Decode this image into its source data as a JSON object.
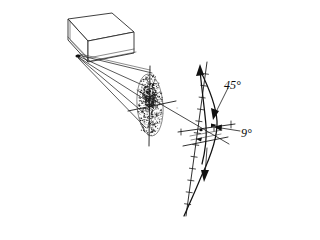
{
  "figure": {
    "background_color": "#ffffff",
    "ink_color": "#111111",
    "width": 268,
    "height": 235
  },
  "labels": {
    "angle_45": "45°",
    "angle_9": "9°",
    "ray_tick_mark": "°"
  },
  "components": {
    "source_box_name": "laser source box",
    "ray_fan_name": "emitted ray fan",
    "scatter_cloud_name": "stippled scattering cloud",
    "probe_axis_name": "tick-marked probe axis",
    "profile_curve_name": "S-shaped profile curve",
    "crosshair_name": "crosshair axes"
  },
  "chart_data": {
    "type": "line",
    "xlabel": "",
    "ylabel": "",
    "annotations": [
      {
        "text": "45°",
        "x": 232,
        "y": 86
      },
      {
        "text": "9°",
        "x": 243,
        "y": 134
      }
    ],
    "series": [
      {
        "name": "profile curve",
        "points": [
          [
            200,
            68
          ],
          [
            208,
            84
          ],
          [
            214,
            100
          ],
          [
            217,
            116
          ],
          [
            216,
            128
          ],
          [
            212,
            142
          ],
          [
            206,
            158
          ],
          [
            199,
            176
          ],
          [
            192,
            196
          ],
          [
            186,
            212
          ]
        ]
      },
      {
        "name": "probe axis",
        "points": [
          [
            207,
            62
          ],
          [
            186,
            216
          ]
        ]
      }
    ],
    "grid": false,
    "legend": "none"
  },
  "ray_fan": {
    "origin": {
      "x": 77,
      "y": 56
    },
    "targets": [
      {
        "x": 150,
        "y": 74
      },
      {
        "x": 147,
        "y": 88
      },
      {
        "x": 146,
        "y": 101
      },
      {
        "x": 145,
        "y": 114
      },
      {
        "x": 146,
        "y": 128
      }
    ]
  },
  "box": {
    "top_face": "68,19 112,13 134,32 88,41",
    "front_face": "88,41 134,32 134,50 88,60",
    "side_face": "68,19 88,41 88,60 68,38"
  }
}
